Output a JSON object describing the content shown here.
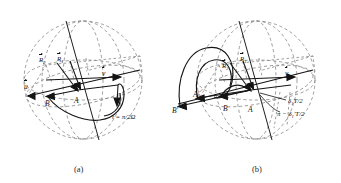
{
  "figure": {
    "panels": [
      {
        "id": "a",
        "caption": "(a)",
        "labels": {
          "R1": "R",
          "R1_sub": "1",
          "R2": "R",
          "R2_sub": "2",
          "u": "u",
          "v": "v",
          "A": "A",
          "B": "B",
          "time_annotation": "t = π/2Ω"
        }
      },
      {
        "id": "b",
        "caption": "(b)",
        "labels": {
          "R1": "R",
          "R1_sub": "1",
          "R2": "R",
          "R2_sub": "2",
          "u": "u",
          "v": "v",
          "A": "A",
          "B": "B",
          "Aprime": "A′",
          "Bprime": "B′",
          "delta_annotation": "δ",
          "delta_annotation_sub": "1",
          "delta_annotation_tail": "T/2",
          "pi_annotation": "π − δ",
          "pi_annotation_sub": "1",
          "pi_annotation_tail": "′T/2"
        }
      }
    ],
    "colors": {
      "sphere_dashed": "#8a8a8a",
      "solid_stroke": "#111111",
      "background": "#ffffff",
      "text": "#121212"
    }
  }
}
